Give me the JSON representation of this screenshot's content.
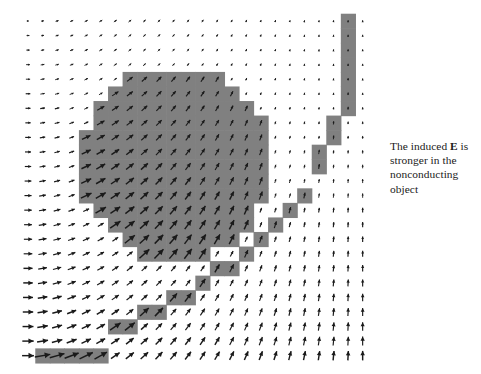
{
  "figure": {
    "background_color": "#ffffff",
    "shaded_color": "#808080",
    "arrow_color": "#1a1a1a",
    "grid": {
      "origin_x": 28,
      "origin_y": 21,
      "spacing": 14.55,
      "cols": 24,
      "rows": 24
    },
    "disk": {
      "center_col": 10.1,
      "center_row": 9.75,
      "radius_cells": 6.6
    },
    "band": {
      "description": "45-degree staircase band of shaded cells crossing the field",
      "cells": [
        [
          1,
          23
        ],
        [
          2,
          23
        ],
        [
          3,
          23
        ],
        [
          4,
          23
        ],
        [
          5,
          23
        ],
        [
          6,
          21
        ],
        [
          7,
          21
        ],
        [
          8,
          20
        ],
        [
          9,
          20
        ],
        [
          10,
          19
        ],
        [
          11,
          19
        ],
        [
          12,
          18
        ],
        [
          13,
          17
        ],
        [
          14,
          17
        ],
        [
          15,
          16
        ],
        [
          16,
          15
        ],
        [
          17,
          14
        ],
        [
          18,
          13
        ],
        [
          19,
          12
        ],
        [
          20,
          10
        ],
        [
          20,
          9
        ],
        [
          21,
          8
        ],
        [
          21,
          7
        ],
        [
          22,
          6
        ],
        [
          22,
          5
        ],
        [
          22,
          4
        ],
        [
          22,
          3
        ],
        [
          22,
          2
        ],
        [
          22,
          1
        ],
        [
          22,
          0
        ]
      ]
    }
  },
  "caption": {
    "line1_a": "The induced ",
    "line1_sym": "E",
    "line1_b": " is",
    "line2": "stronger in the",
    "line3": "nonconducting",
    "line4": "object",
    "full_text": "The induced E is stronger in the nonconducting object"
  },
  "chart_data": {
    "type": "scatter",
    "xlabel": "",
    "ylabel": "",
    "legend": [],
    "annotations": [
      "The induced E is stronger in the nonconducting object"
    ],
    "field_model": {
      "angle_deg_min": 0,
      "angle_deg_max": 90,
      "magnitude_min": 0.05,
      "magnitude_max": 1.0,
      "disk_magnitude_boost": 1.9
    }
  }
}
